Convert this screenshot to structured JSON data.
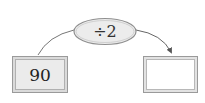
{
  "diagram": {
    "input": {
      "value": "90"
    },
    "operation": {
      "label": "÷2"
    },
    "output": {
      "value": ""
    },
    "colors": {
      "input_fill": "#ebebeb",
      "operation_fill": "#ececec",
      "output_fill": "#ffffff",
      "stroke": "#8a8a8a",
      "arrow": "#555555"
    }
  }
}
